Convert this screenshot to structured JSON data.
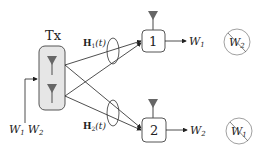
{
  "diagram": {
    "transmitter": {
      "label": "Tx",
      "input_label_w1": "W",
      "input_label_w1_sub": "1",
      "input_label_w2": "W",
      "input_label_w2_sub": "2"
    },
    "channels": [
      {
        "label": "H",
        "sub": "1",
        "arg": "(t)"
      },
      {
        "label": "H",
        "sub": "2",
        "arg": "(t)"
      }
    ],
    "receivers": [
      {
        "label": "1",
        "desired": "W",
        "desired_sub": "1",
        "interference": "W",
        "interference_sub": "2"
      },
      {
        "label": "2",
        "desired": "W",
        "desired_sub": "2",
        "interference": "W",
        "interference_sub": "1"
      }
    ],
    "colors": {
      "box_fill": "#e6e6e6",
      "box_stroke": "#555555",
      "antenna": "#666666",
      "line": "#222222",
      "circle_stroke": "#888888"
    }
  }
}
